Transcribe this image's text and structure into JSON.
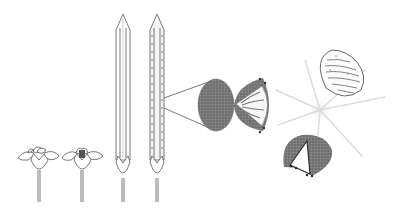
{
  "figure": {
    "background": "#ffffff",
    "stroke_color": "#555555",
    "fill_dark": "#6e6e6e",
    "fill_light": "#f4f4f4"
  },
  "elements": [
    {
      "id": "flower-open",
      "description": "Open flower with petals on stalk"
    },
    {
      "id": "flower-dark-center",
      "description": "Open flower with dark central anthers"
    },
    {
      "id": "elongated-bud-plain",
      "description": "Tall elongated spear-shaped structure, plain"
    },
    {
      "id": "elongated-bud-dotted",
      "description": "Tall elongated spear-shaped structure with dotted rows"
    },
    {
      "id": "magnified-grain",
      "description": "Dark stippled oval magnified from dotted structure"
    },
    {
      "id": "half-opened-grain",
      "description": "Half-open grain with striped interior"
    },
    {
      "id": "sparkle",
      "description": "Light starburst rays"
    },
    {
      "id": "striped-seed",
      "description": "Teardrop seed with wavy stripes"
    },
    {
      "id": "split-grain",
      "description": "Dark half-circle grain split with wedge"
    }
  ]
}
